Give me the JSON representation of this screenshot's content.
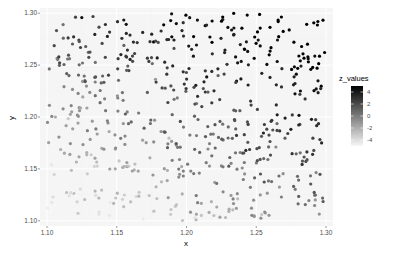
{
  "chart_data": {
    "type": "scatter",
    "title": "",
    "xlabel": "x",
    "ylabel": "y",
    "xlim": [
      1.095,
      1.305
    ],
    "ylim": [
      1.095,
      1.305
    ],
    "x_ticks": [
      1.1,
      1.15,
      1.2,
      1.25,
      1.3
    ],
    "x_tick_labels": [
      "1.10",
      "1.15",
      "1.20",
      "1.25",
      "1.30"
    ],
    "y_ticks": [
      1.1,
      1.15,
      1.2,
      1.25,
      1.3
    ],
    "y_tick_labels": [
      "1.10",
      "1.15",
      "1.20",
      "1.25",
      "1.30"
    ],
    "grid": true,
    "legend": {
      "title": "z_values",
      "placement": "right",
      "type": "colorbar",
      "range": [
        -5,
        5
      ],
      "breaks": [
        4,
        2,
        0,
        -2,
        -4
      ],
      "break_labels": [
        "4",
        "2",
        "0",
        "-2",
        "-4"
      ],
      "low_color": "#f7f7f7",
      "high_color": "#000000"
    },
    "point_count": 600,
    "z_model": "z increases with x and y (approx. z = 25*(x-1.2) + 40*(y-1.2) + noise)",
    "colors": {
      "panel_background": "#ebebeb",
      "grid_major": "#ffffff",
      "grid_minor": "#f2f2f2"
    }
  }
}
